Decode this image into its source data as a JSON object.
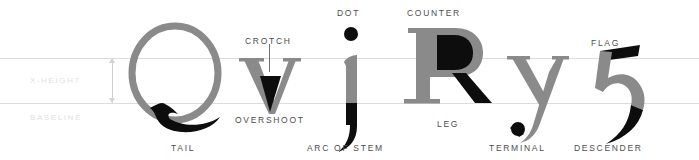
{
  "diagram": {
    "width": 699,
    "height": 160,
    "background": "#ffffff"
  },
  "colors": {
    "glyph_gray": "#8a8a8a",
    "glyph_black": "#0d0d0d",
    "guide_line": "#dcdcdc",
    "margin_label": "#e2e2e2",
    "callout_label": "#4d4d4d",
    "measure_arrow": "#d2d2d2",
    "pointer_line": "#6e6e6e"
  },
  "guides": {
    "xheight_label": "X-HEIGHT",
    "baseline_label": "BASELINE",
    "xheight_y": 58,
    "baseline_y": 103
  },
  "glyphs": [
    {
      "id": "Q",
      "character": "Q",
      "feature": "TAIL"
    },
    {
      "id": "v",
      "character": "v",
      "feature": "CROTCH"
    },
    {
      "id": "j",
      "character": "j",
      "feature": "DOT"
    },
    {
      "id": "R",
      "character": "R",
      "feature": "COUNTER"
    },
    {
      "id": "y",
      "character": "y",
      "feature": "TERMINAL"
    },
    {
      "id": "5",
      "character": "5",
      "feature": "FLAG"
    }
  ],
  "callouts": {
    "crotch": "CROTCH",
    "dot": "DOT",
    "counter": "COUNTER",
    "flag": "FLAG",
    "overshoot": "OVERSHOOT",
    "leg": "LEG",
    "tail": "TAIL",
    "arc_of_stem": "ARC OF STEM",
    "terminal": "TERMINAL",
    "descender": "DESCENDER"
  }
}
